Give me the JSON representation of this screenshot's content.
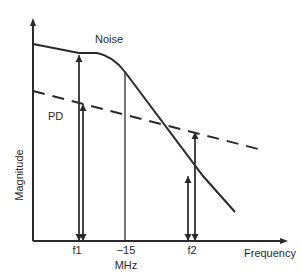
{
  "diagram": {
    "type": "frequency-response sketch",
    "x_axis_label": "Frequency",
    "y_axis_label": "Magnitude",
    "curves": [
      {
        "name": "Noise",
        "label": "Noise",
        "style": "solid"
      },
      {
        "name": "PD",
        "label": "PD",
        "style": "dashed"
      }
    ],
    "x_ticks": [
      {
        "label": "f1"
      },
      {
        "label": "−15"
      },
      {
        "label": "f2"
      }
    ],
    "x_unit": "MHz",
    "colors": {
      "line": "#2a2a2a",
      "background": "#ffffff"
    }
  }
}
